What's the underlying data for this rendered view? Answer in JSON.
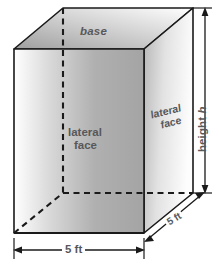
{
  "figure": {
    "type": "rectangular-prism-diagram",
    "labels": {
      "base": "base",
      "lateral_face_front_line1": "lateral",
      "lateral_face_front_line2": "face",
      "lateral_face_right_line1": "lateral",
      "lateral_face_right_line2": "face",
      "height": "height ",
      "height_variable": "h",
      "width_dimension": "5 ft",
      "depth_dimension": "5 ft"
    },
    "dimensions": {
      "width": "5 ft",
      "depth": "5 ft",
      "height": "h"
    },
    "colors": {
      "outline": "#1a1a1a",
      "text": "#58585a",
      "top_face_light": "#ffffff",
      "top_face_dark": "#a8a8a8",
      "front_face_light": "#ffffff",
      "front_face_dark": "#a6a6a6",
      "right_face_light": "#fdfdfd",
      "right_face_dark": "#b4b4b4",
      "bottom_face": "#8c8c8c",
      "background": "#ffffff"
    },
    "geometry": {
      "front_top_left": [
        14,
        49
      ],
      "front_top_right": [
        144,
        49
      ],
      "front_bottom_right": [
        144,
        233
      ],
      "front_bottom_left": [
        14,
        233
      ],
      "back_top_left": [
        63,
        8
      ],
      "back_top_right": [
        193,
        8
      ],
      "back_bottom_right": [
        193,
        193
      ],
      "back_bottom_left": [
        63,
        193
      ]
    }
  }
}
